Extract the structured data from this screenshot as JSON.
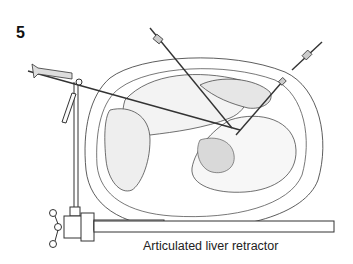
{
  "figure": {
    "number": "5",
    "caption": "Articulated liver retractor"
  },
  "colors": {
    "background": "#ffffff",
    "line": "#333333",
    "shade": "#888888"
  }
}
